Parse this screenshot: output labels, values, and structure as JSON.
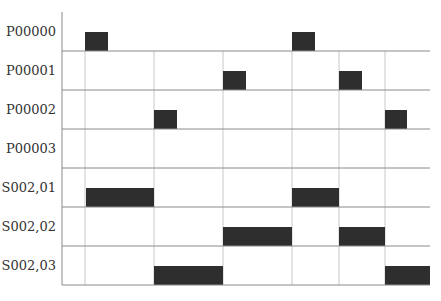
{
  "diagram": {
    "type": "timing",
    "colors": {
      "pulse": "#2e2e2e",
      "baseline": "#8a8a8a",
      "guide": "#c8c8c8",
      "text": "#333333"
    },
    "guides_x": [
      85,
      154,
      223,
      292,
      339,
      385
    ],
    "rows": [
      {
        "label": "P00000",
        "baseline_y": 51,
        "pulses": [
          [
            85,
            108
          ],
          [
            292,
            315
          ]
        ]
      },
      {
        "label": "P00001",
        "baseline_y": 90,
        "pulses": [
          [
            223,
            246
          ],
          [
            339,
            362
          ]
        ]
      },
      {
        "label": "P00002",
        "baseline_y": 129,
        "pulses": [
          [
            154,
            177
          ],
          [
            385,
            407
          ]
        ]
      },
      {
        "label": "P00003",
        "baseline_y": 168,
        "pulses": []
      },
      {
        "label": "S002,01",
        "baseline_y": 207,
        "pulses": [
          [
            86,
            154
          ],
          [
            292,
            339
          ]
        ]
      },
      {
        "label": "S002,02",
        "baseline_y": 246,
        "pulses": [
          [
            223,
            292
          ],
          [
            339,
            385
          ]
        ]
      },
      {
        "label": "S002,03",
        "baseline_y": 285,
        "pulses": [
          [
            154,
            223
          ],
          [
            385,
            430
          ]
        ]
      }
    ]
  }
}
